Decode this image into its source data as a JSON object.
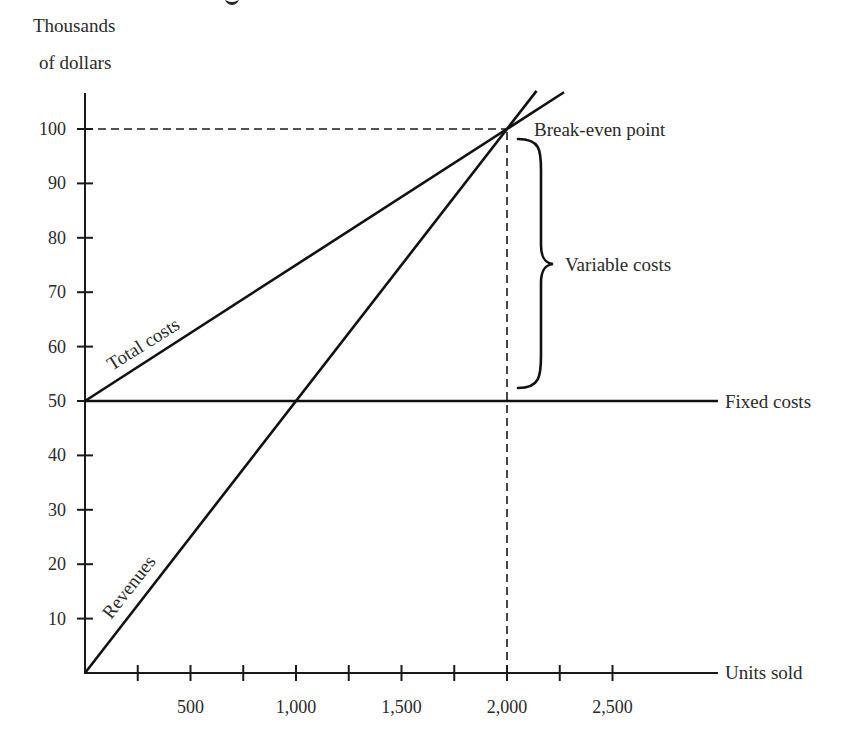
{
  "chart_data": {
    "type": "line",
    "title": "",
    "xlabel": "Units sold",
    "ylabel": "Thousands of dollars",
    "ylabel_lines": [
      "Thousands",
      "of dollars"
    ],
    "xlim": [
      0,
      3000
    ],
    "ylim": [
      0,
      106
    ],
    "x_ticks": [
      250,
      500,
      750,
      1000,
      1250,
      1500,
      1750,
      2000,
      2250,
      2500
    ],
    "x_tick_labels": [
      {
        "value": 500,
        "label": "500"
      },
      {
        "value": 1000,
        "label": "1,000"
      },
      {
        "value": 1500,
        "label": "1,500"
      },
      {
        "value": 2000,
        "label": "2,000"
      },
      {
        "value": 2500,
        "label": "2,500"
      }
    ],
    "y_ticks": [
      10,
      20,
      30,
      40,
      50,
      60,
      70,
      80,
      90,
      100
    ],
    "y_tick_labels": [
      "10",
      "20",
      "30",
      "40",
      "50",
      "60",
      "70",
      "80",
      "90",
      "100"
    ],
    "grid": false,
    "legend": "none (inline labels)",
    "series": [
      {
        "name": "Revenues",
        "x": [
          0,
          2140
        ],
        "y": [
          0,
          107
        ],
        "equation": "y = 0.05x",
        "label": "Revenues"
      },
      {
        "name": "Total costs",
        "x": [
          0,
          2270
        ],
        "y": [
          50,
          106.75
        ],
        "equation": "y = 50 + 0.025x",
        "label": "Total costs"
      },
      {
        "name": "Fixed costs",
        "x": [
          0,
          3000
        ],
        "y": [
          50,
          50
        ],
        "equation": "y = 50",
        "label": "Fixed costs"
      }
    ],
    "annotations": [
      {
        "type": "point",
        "label": "Break-even point",
        "x": 2000,
        "y": 100
      },
      {
        "type": "brace",
        "label": "Variable costs",
        "x": 2000,
        "y_from": 50,
        "y_to": 100
      },
      {
        "type": "dashed-guide",
        "from": [
          0,
          100
        ],
        "to": [
          2000,
          100
        ]
      },
      {
        "type": "dashed-guide",
        "from": [
          2000,
          0
        ],
        "to": [
          2000,
          100
        ]
      }
    ]
  },
  "labels": {
    "y_axis_line1": "Thousands",
    "y_axis_line2": "of dollars",
    "x_axis": "Units sold",
    "revenues": "Revenues",
    "total_costs": "Total costs",
    "fixed_costs": "Fixed costs",
    "break_even": "Break-even point",
    "variable_costs": "Variable costs"
  }
}
